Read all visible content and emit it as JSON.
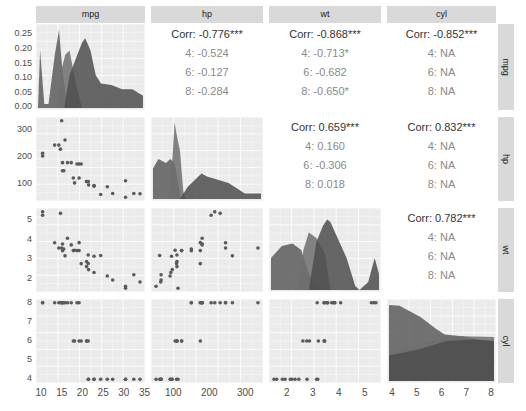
{
  "chart_data": {
    "type": "pairs_matrix",
    "title": "",
    "variables": [
      "mpg",
      "hp",
      "wt",
      "cyl"
    ],
    "group_variable": "cyl",
    "groups": [
      "4",
      "6",
      "8"
    ],
    "colors": {
      "panel_bg": "#ebebeb",
      "strip_bg": "#d9d9d9",
      "fill": "#595959",
      "point": "#595959",
      "grid": "#ffffff"
    },
    "column_strips": [
      "mpg",
      "hp",
      "wt",
      "cyl"
    ],
    "row_strips": [
      "mpg",
      "hp",
      "wt",
      "cyl"
    ],
    "axes": {
      "mpg": {
        "ticks": [
          "10",
          "15",
          "20",
          "25",
          "30",
          "35"
        ],
        "range": [
          10,
          35
        ]
      },
      "hp": {
        "ticks": [
          "100",
          "200",
          "300"
        ],
        "range": [
          52,
          335
        ]
      },
      "wt": {
        "ticks": [
          "2",
          "3",
          "4",
          "5"
        ],
        "range": [
          1.5,
          5.45
        ]
      },
      "cyl": {
        "ticks": [
          "4",
          "5",
          "6",
          "7",
          "8"
        ],
        "range": [
          4,
          8
        ]
      },
      "density_y": {
        "ticks": [
          "0.00",
          "0.05",
          "0.10",
          "0.15",
          "0.20",
          "0.25"
        ],
        "range": [
          0,
          0.25
        ]
      },
      "hp_y": {
        "ticks": [
          "100",
          "200",
          "300"
        ]
      },
      "wt_y": {
        "ticks": [
          "2",
          "3",
          "4",
          "5"
        ]
      },
      "cyl_y": {
        "ticks": [
          "4",
          "5",
          "6",
          "7",
          "8"
        ]
      }
    },
    "correlations": {
      "mpg_hp": {
        "overall": "Corr: -0.776***",
        "groups": [
          "4: -0.524",
          "6: -0.127",
          "8: -0.284"
        ]
      },
      "mpg_wt": {
        "overall": "Corr: -0.868***",
        "groups": [
          "4: -0.713*",
          "6: -0.682",
          "8: -0.650*"
        ]
      },
      "mpg_cyl": {
        "overall": "Corr: -0.852***",
        "groups": [
          "4:   NA",
          "6:   NA",
          "8:   NA"
        ]
      },
      "hp_wt": {
        "overall": "Corr: 0.659***",
        "groups": [
          "4: 0.160",
          "6: -0.306",
          "8: 0.018"
        ]
      },
      "hp_cyl": {
        "overall": "Corr: 0.832***",
        "groups": [
          "4:   NA",
          "6:   NA",
          "8:   NA"
        ]
      },
      "wt_cyl": {
        "overall": "Corr: 0.782***",
        "groups": [
          "4:   NA",
          "6:   NA",
          "8:   NA"
        ]
      }
    },
    "scatter": {
      "mpg": [
        21,
        21,
        22.8,
        21.4,
        18.7,
        18.1,
        14.3,
        24.4,
        22.8,
        19.2,
        17.8,
        16.4,
        17.3,
        15.2,
        10.4,
        10.4,
        14.7,
        32.4,
        30.4,
        33.9,
        21.5,
        15.5,
        15.2,
        13.3,
        19.2,
        27.3,
        26,
        30.4,
        15.8,
        19.7,
        15,
        21.4
      ],
      "hp": [
        110,
        110,
        93,
        110,
        175,
        105,
        245,
        62,
        95,
        123,
        123,
        180,
        180,
        180,
        205,
        215,
        230,
        66,
        52,
        65,
        97,
        150,
        150,
        245,
        175,
        66,
        91,
        113,
        264,
        175,
        335,
        109
      ],
      "wt": [
        2.62,
        2.875,
        2.32,
        3.215,
        3.44,
        3.46,
        3.57,
        3.19,
        3.15,
        3.44,
        3.44,
        4.07,
        3.73,
        3.78,
        5.25,
        5.424,
        5.345,
        2.2,
        1.615,
        1.835,
        2.465,
        3.52,
        3.435,
        3.84,
        3.845,
        1.935,
        2.14,
        1.513,
        3.17,
        2.77,
        3.57,
        2.78
      ],
      "cyl": [
        6,
        6,
        4,
        6,
        8,
        6,
        8,
        4,
        4,
        6,
        6,
        8,
        8,
        8,
        8,
        8,
        8,
        4,
        4,
        4,
        4,
        8,
        8,
        8,
        8,
        4,
        4,
        4,
        8,
        6,
        8,
        4
      ]
    }
  }
}
